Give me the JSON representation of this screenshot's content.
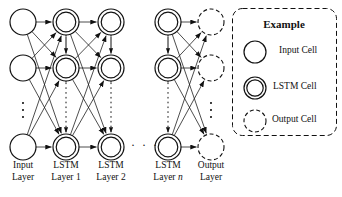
{
  "figure": {
    "type": "neural-network-architecture-diagram",
    "background": "#ffffff",
    "stroke": "#111111",
    "width": 342,
    "height": 197
  },
  "network": {
    "ellipsis_horizontal": "· · ·",
    "ellipsis_vertical": "⋮",
    "columns": [
      {
        "id": "input",
        "cell_type": "input",
        "cx": 23,
        "label_line1": "Input",
        "label_line2": "Layer",
        "label_italic_suffix": ""
      },
      {
        "id": "lstm1",
        "cell_type": "lstm",
        "cx": 66,
        "label_line1": "LSTM",
        "label_line2": "Layer 1",
        "label_italic_suffix": ""
      },
      {
        "id": "lstm2",
        "cell_type": "lstm",
        "cx": 111,
        "label_line1": "LSTM",
        "label_line2": "Layer 2",
        "label_italic_suffix": ""
      },
      {
        "id": "lstmn",
        "cell_type": "lstm",
        "cx": 168,
        "label_line1": "LSTM",
        "label_line2": "Layer ",
        "label_italic_suffix": "n"
      },
      {
        "id": "output",
        "cell_type": "output",
        "cx": 211,
        "label_line1": "Output",
        "label_line2": "Layer",
        "label_italic_suffix": ""
      }
    ],
    "rows": [
      22,
      68,
      147
    ],
    "row_dots_y": 110,
    "node_radius": 13,
    "labels_y": 160
  },
  "legend": {
    "title": "Example",
    "items": [
      {
        "id": "input-cell",
        "label": "Input Cell",
        "style": "single-circle"
      },
      {
        "id": "lstm-cell",
        "label": "LSTM Cell",
        "style": "double-circle"
      },
      {
        "id": "output-cell",
        "label": "Output Cell",
        "style": "dashed-circle"
      }
    ],
    "box": {
      "x": 232,
      "y": 8,
      "width": 104,
      "height": 127,
      "border": "dashed",
      "radius": 10
    }
  }
}
